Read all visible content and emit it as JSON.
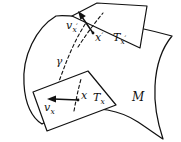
{
  "figure": {
    "width": 181,
    "height": 142,
    "background_color": "#ffffff",
    "ink_color": "#111111",
    "surface_fill_color": "#d4d4d4",
    "plane_fill_color": "#ffffff"
  },
  "labels": {
    "manifold": "M",
    "tangent_space_lower": "T",
    "tangent_space_lower_sub": "x",
    "tangent_space_upper": "T",
    "tangent_space_upper_sub": "x",
    "tangent_space_upper_prime": "′",
    "point_lower": "x",
    "point_upper": "x",
    "point_upper_prime": "′",
    "vector_lower": "v",
    "vector_lower_sub": "x",
    "vector_upper": "v",
    "vector_upper_sub": "x",
    "vector_upper_prime": "′",
    "geodesic": "γ"
  },
  "elements": {
    "manifold_surface_name": "curved shaded manifold sheet",
    "lower_plane_name": "tangent plane at x",
    "upper_plane_name": "tangent plane at x prime",
    "geodesic_name": "dashed geodesic curve gamma",
    "lower_vector_name": "tangent vector v_x pointing left",
    "upper_vector_name": "tangent vector v_x' pointing up-left"
  },
  "geometry": {
    "manifold_path": "M 56 16 C 36 28 22 56 24 84 C 25 104 32 118 42 124 C 52 118 62 112 74 110 C 96 106 120 110 138 122 C 150 130 158 136 163 139 C 158 124 154 104 155 86 C 156 66 162 48 172 36 C 150 30 122 24 98 20 C 82 17 66 15 56 16 Z",
    "lower_plane_points": "33,92 88,71 116,105 47,131",
    "upper_plane_points": "72,16 97,3 147,6 140,48",
    "geodesic_path": "M 47 112 C 52 100 58 84 64 68 C 70 52 78 34 88 20",
    "lower_vector": {
      "x1": 78,
      "y1": 100,
      "x2": 50,
      "y2": 99
    },
    "upper_vector": {
      "x1": 93,
      "y1": 33,
      "x2": 80,
      "y2": 14
    },
    "lower_point": {
      "cx": 78,
      "cy": 100
    },
    "upper_point": {
      "cx": 93,
      "cy": 33
    }
  },
  "label_positions": {
    "manifold": {
      "x": 132,
      "y": 101
    },
    "tangent_lower": {
      "x": 93,
      "y": 101
    },
    "tangent_upper": {
      "x": 113,
      "y": 41
    },
    "point_lower": {
      "x": 81,
      "y": 99
    },
    "point_upper": {
      "x": 96,
      "y": 40
    },
    "vector_lower": {
      "x": 45,
      "y": 110
    },
    "vector_upper": {
      "x": 67,
      "y": 29
    },
    "geodesic": {
      "x": 58,
      "y": 63
    }
  }
}
